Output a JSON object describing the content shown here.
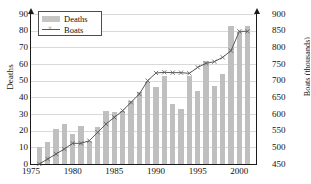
{
  "chart_data": {
    "type": "bar",
    "title": "",
    "xlabel": "",
    "ylabel": "Deaths",
    "y2label": "Boats (thousands)",
    "grid": true,
    "legend_position": "top-left",
    "xlim": [
      1975,
      2002
    ],
    "ylim": [
      0,
      90
    ],
    "y2lim": [
      450,
      900
    ],
    "ytick_step": 10,
    "y2tick_step": 50,
    "xticks": [
      1975,
      1980,
      1985,
      1990,
      1995,
      2000
    ],
    "ytick_labels": [
      "0",
      "10",
      "20",
      "30",
      "40",
      "50",
      "60",
      "70",
      "80",
      "90"
    ],
    "y2tick_labels": [
      "450",
      "500",
      "550",
      "600",
      "650",
      "700",
      "750",
      "800",
      "850",
      "900"
    ],
    "legend": [
      {
        "label": "Deaths",
        "marker": "bar",
        "color": "#bfbfbf"
      },
      {
        "label": "Boats",
        "marker": "line-x",
        "color": "#5a5a5a"
      }
    ],
    "x": [
      1976,
      1977,
      1978,
      1979,
      1980,
      1981,
      1982,
      1983,
      1984,
      1985,
      1986,
      1987,
      1988,
      1989,
      1990,
      1991,
      1992,
      1993,
      1994,
      1995,
      1996,
      1997,
      1998,
      1999,
      2000,
      2001
    ],
    "series": [
      {
        "name": "Deaths",
        "axis": "left",
        "type": "bar",
        "color": "#bfbfbf",
        "values": [
          10,
          13,
          21,
          24,
          18,
          23,
          14,
          22,
          32,
          31,
          32,
          38,
          43,
          49,
          46,
          53,
          36,
          33,
          53,
          44,
          62,
          47,
          54,
          83,
          79,
          83
        ]
      },
      {
        "name": "Boats",
        "axis": "right",
        "type": "line",
        "color": "#5a5a5a",
        "marker": "x",
        "values": [
          450,
          465,
          480,
          495,
          512,
          512,
          520,
          545,
          570,
          590,
          610,
          635,
          660,
          700,
          723,
          725,
          724,
          724,
          722,
          740,
          752,
          757,
          770,
          790,
          848,
          848
        ]
      }
    ]
  }
}
